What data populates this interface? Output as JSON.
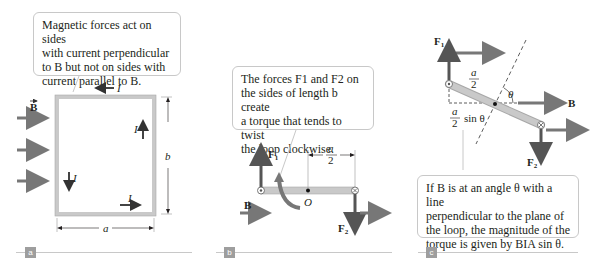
{
  "panels": [
    {
      "id": "a",
      "label": "a",
      "callout": {
        "lines": [
          "Magnetic forces act on sides",
          "with current perpendicular",
          "to B but not on sides with",
          "current parallel to B."
        ]
      },
      "symbols": {
        "B": "B",
        "I": "I",
        "a": "a",
        "b": "b"
      }
    },
    {
      "id": "b",
      "label": "b",
      "callout": {
        "lines": [
          "The forces F1 and F2 on",
          "the sides of length b create",
          "a torque that tends to twist",
          "the loop clockwise."
        ]
      },
      "symbols": {
        "F1": "F",
        "F1_sub": "1",
        "F2": "F",
        "F2_sub": "2",
        "B": "B",
        "O": "O",
        "half_num": "a",
        "half_den": "2"
      }
    },
    {
      "id": "c",
      "label": "c",
      "callout": {
        "lines": [
          "If B is at an angle θ with a line",
          "perpendicular to the plane of",
          "the loop, the magnitude of the",
          "torque is given by BIA sin θ."
        ]
      },
      "symbols": {
        "F1": "F",
        "F1_sub": "1",
        "F2": "F",
        "F2_sub": "2",
        "B": "B",
        "theta": "θ",
        "half_num": "a",
        "half_den": "2",
        "sin_theta": "sin θ"
      }
    }
  ],
  "colors": {
    "arrow": "#777777",
    "loop_fill": "#c9c9c9",
    "loop_edge": "#a8a8a8",
    "callout_border": "#c8c8c8",
    "tag": "#9e9e9e",
    "rule": "#c8c8c8"
  }
}
